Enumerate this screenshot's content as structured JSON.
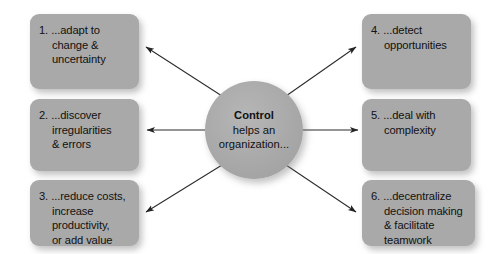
{
  "diagram": {
    "title": "Control helps an organization",
    "center": {
      "title": "Control",
      "line2": "helps an",
      "line3": "organization..."
    },
    "boxes": [
      {
        "id": "box-1",
        "number": "1.",
        "lines": [
          "1. ...adapt to",
          "change &",
          "uncertainty"
        ],
        "line1": "1. ...adapt to",
        "line2": "change &",
        "line3": "uncertainty",
        "line4": ""
      },
      {
        "id": "box-2",
        "number": "2.",
        "lines": [
          "2. ...discover",
          "irregularities",
          "& errors"
        ],
        "line1": "2. ...discover",
        "line2": "irregularities",
        "line3": "& errors",
        "line4": ""
      },
      {
        "id": "box-3",
        "number": "3.",
        "lines": [
          "3. ...reduce costs,",
          "increase",
          "productivity,",
          "or add value"
        ],
        "line1": "3. ...reduce costs,",
        "line2": "increase",
        "line3": "productivity,",
        "line4": "or add value"
      },
      {
        "id": "box-4",
        "number": "4.",
        "lines": [
          "4. ...detect",
          "opportunities"
        ],
        "line1": "4. ...detect",
        "line2": "opportunities",
        "line3": "",
        "line4": ""
      },
      {
        "id": "box-5",
        "number": "5.",
        "lines": [
          "5. ...deal with",
          "complexity"
        ],
        "line1": "5. ...deal with",
        "line2": "complexity",
        "line3": "",
        "line4": ""
      },
      {
        "id": "box-6",
        "number": "6.",
        "lines": [
          "6. ...decentralize",
          "decision making",
          "& facilitate",
          "teamwork"
        ],
        "line1": "6. ...decentralize",
        "line2": "decision making",
        "line3": "& facilitate",
        "line4": "teamwork"
      }
    ],
    "connectors": [
      {
        "name": "arrow-to-box-1",
        "from": "center",
        "to": "box-1",
        "direction": "up-left"
      },
      {
        "name": "arrow-to-box-2",
        "from": "center",
        "to": "box-2",
        "direction": "left"
      },
      {
        "name": "arrow-to-box-3",
        "from": "center",
        "to": "box-3",
        "direction": "down-left"
      },
      {
        "name": "arrow-to-box-4",
        "from": "center",
        "to": "box-4",
        "direction": "up-right"
      },
      {
        "name": "arrow-to-box-5",
        "from": "center",
        "to": "box-5",
        "direction": "right"
      },
      {
        "name": "arrow-to-box-6",
        "from": "center",
        "to": "box-6",
        "direction": "down-right"
      }
    ],
    "colors": {
      "box_fill": "#a9a9a9",
      "circle_fill": "#a8a8a8",
      "text": "#111111",
      "arrow": "#2b2b2b",
      "background": "#fdfdfd"
    }
  }
}
